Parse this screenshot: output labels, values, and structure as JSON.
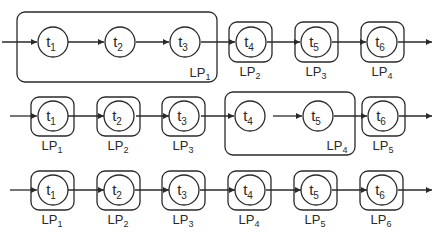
{
  "diagram": {
    "type": "pipeline-partitioning",
    "colors": {
      "stroke": "#2a2a2a",
      "background": "#ffffff"
    },
    "rows": [
      {
        "tasks": [
          "t1",
          "t2",
          "t3",
          "t4",
          "t5",
          "t6"
        ],
        "partitions": [
          {
            "label": "LP",
            "sub": "1",
            "tasks": [
              "t1",
              "t2",
              "t3"
            ]
          },
          {
            "label": "LP",
            "sub": "2",
            "tasks": [
              "t4"
            ]
          },
          {
            "label": "LP",
            "sub": "3",
            "tasks": [
              "t5"
            ]
          },
          {
            "label": "LP",
            "sub": "4",
            "tasks": [
              "t6"
            ]
          }
        ]
      },
      {
        "tasks": [
          "t1",
          "t2",
          "t3",
          "t4",
          "t5",
          "t6"
        ],
        "partitions": [
          {
            "label": "LP",
            "sub": "1",
            "tasks": [
              "t1"
            ]
          },
          {
            "label": "LP",
            "sub": "2",
            "tasks": [
              "t2"
            ]
          },
          {
            "label": "LP",
            "sub": "3",
            "tasks": [
              "t3"
            ]
          },
          {
            "label": "LP",
            "sub": "4",
            "tasks": [
              "t4",
              "t5"
            ]
          },
          {
            "label": "LP",
            "sub": "5",
            "tasks": [
              "t6"
            ]
          }
        ]
      },
      {
        "tasks": [
          "t1",
          "t2",
          "t3",
          "t4",
          "t5",
          "t6"
        ],
        "partitions": [
          {
            "label": "LP",
            "sub": "1",
            "tasks": [
              "t1"
            ]
          },
          {
            "label": "LP",
            "sub": "2",
            "tasks": [
              "t2"
            ]
          },
          {
            "label": "LP",
            "sub": "3",
            "tasks": [
              "t3"
            ]
          },
          {
            "label": "LP",
            "sub": "4",
            "tasks": [
              "t4"
            ]
          },
          {
            "label": "LP",
            "sub": "5",
            "tasks": [
              "t5"
            ]
          },
          {
            "label": "LP",
            "sub": "6",
            "tasks": [
              "t6"
            ]
          }
        ]
      }
    ]
  },
  "labels": {
    "r1": {
      "t": [
        "t",
        "t",
        "t",
        "t",
        "t",
        "t"
      ],
      "ts": [
        "1",
        "2",
        "3",
        "4",
        "5",
        "6"
      ],
      "lp": [
        "LP",
        "LP",
        "LP",
        "LP"
      ],
      "lps": [
        "1",
        "2",
        "3",
        "4"
      ]
    },
    "r2": {
      "t": [
        "t",
        "t",
        "t",
        "t",
        "t",
        "t"
      ],
      "ts": [
        "1",
        "2",
        "3",
        "4",
        "5",
        "6"
      ],
      "lp": [
        "LP",
        "LP",
        "LP",
        "LP",
        "LP"
      ],
      "lps": [
        "1",
        "2",
        "3",
        "4",
        "5"
      ]
    },
    "r3": {
      "t": [
        "t",
        "t",
        "t",
        "t",
        "t",
        "t"
      ],
      "ts": [
        "1",
        "2",
        "3",
        "4",
        "5",
        "6"
      ],
      "lp": [
        "LP",
        "LP",
        "LP",
        "LP",
        "LP",
        "LP"
      ],
      "lps": [
        "1",
        "2",
        "3",
        "4",
        "5",
        "6"
      ]
    }
  }
}
